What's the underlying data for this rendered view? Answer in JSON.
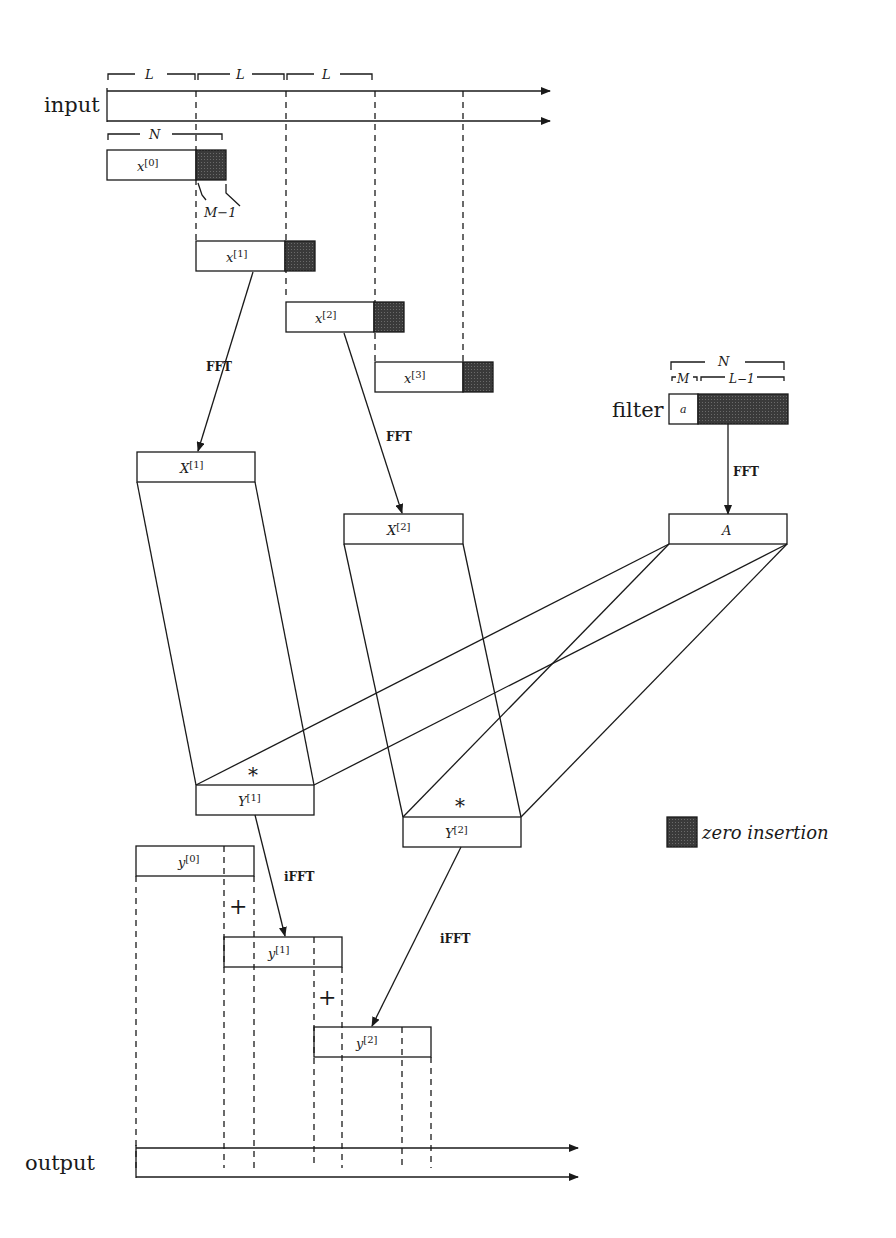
{
  "diagram": {
    "colors": {
      "line": "#1a1a1a",
      "zero_fill": "#3a3a3a",
      "background": "#ffffff"
    },
    "labels": {
      "input": "input",
      "output": "output",
      "filter": "filter",
      "L": "L",
      "N": "N",
      "M_minus_1": "M−1",
      "M": "M",
      "L_minus_1": "L−1",
      "a": "a",
      "fft": "FFT",
      "ifft": "iFFT",
      "star": "*",
      "plus": "+",
      "legend": "zero insertion"
    },
    "blocks": {
      "x0": {
        "base": "x",
        "sup": "[0]"
      },
      "x1": {
        "base": "x",
        "sup": "[1]"
      },
      "x2": {
        "base": "x",
        "sup": "[2]"
      },
      "x3": {
        "base": "x",
        "sup": "[3]"
      },
      "X1": {
        "base": "X",
        "sup": "[1]"
      },
      "X2": {
        "base": "X",
        "sup": "[2]"
      },
      "A": {
        "base": "A",
        "sup": ""
      },
      "Y1": {
        "base": "Y",
        "sup": "[1]"
      },
      "Y2": {
        "base": "Y",
        "sup": "[2]"
      },
      "y0": {
        "base": "y",
        "sup": "[0]"
      },
      "y1": {
        "base": "y",
        "sup": "[1]"
      },
      "y2": {
        "base": "y",
        "sup": "[2]"
      }
    }
  }
}
